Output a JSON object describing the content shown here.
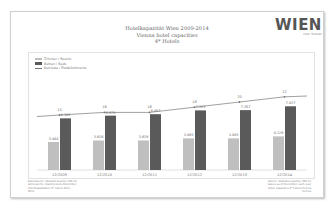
{
  "header": {
    "title_de": "Hotelkapazität Wien 2009-2014",
    "title_en": "Vienna hotel capacities",
    "subtitle": "4* Hotels"
  },
  "logo": {
    "word": "WIEN",
    "tagline": "now. forever"
  },
  "legend": [
    {
      "label": "Zimmer / Rooms",
      "color": "#bfbfbf"
    },
    {
      "label": "Betten / Beds",
      "color": "#5a5a5a"
    },
    {
      "label": "Betriebe / Establishments",
      "color": "#777777"
    }
  ],
  "footnotes": {
    "left": [
      "Datenquelle: Statistik Austria / MA 23",
      "Jahreswerte, Stand jeweils Dezember",
      "Hotelkapazitäten 4* Hotels Wien",
      "Wien"
    ],
    "right": [
      "Source: Statistics Austria / MA 23",
      "Values as of December each year",
      "Hotel capacities 4* hotels Vienna",
      "Vienna"
    ]
  },
  "chart_data": {
    "type": "bar",
    "categories": [
      "12/2009",
      "12/2010",
      "12/2011",
      "12/2012",
      "12/2013",
      "12/2014"
    ],
    "series": [
      {
        "name": "Zimmer / Rooms",
        "type": "bar",
        "color": "#bfbfbf",
        "values": [
          3444,
          3626,
          3626,
          3885,
          3885,
          4129
        ],
        "labels": [
          "3.444",
          "3.626",
          "3.626",
          "3.885",
          "3.885",
          "4.129"
        ]
      },
      {
        "name": "Betten / Beds",
        "type": "bar",
        "color": "#5a5a5a",
        "values": [
          6345,
          6678,
          6857,
          7323,
          7357,
          7827
        ],
        "labels": [
          "6.345",
          "6.678",
          "6.857",
          "7.323",
          "7.357",
          "7.827"
        ]
      },
      {
        "name": "Betriebe / Establishments",
        "type": "line",
        "color": "#777777",
        "values": [
          15,
          16,
          16,
          18,
          20,
          22
        ],
        "labels": [
          "15",
          "16",
          "16",
          "18",
          "20",
          "22"
        ]
      }
    ],
    "xlabel": "",
    "ylabel": "",
    "grid": false,
    "legend_position": "top-left"
  }
}
